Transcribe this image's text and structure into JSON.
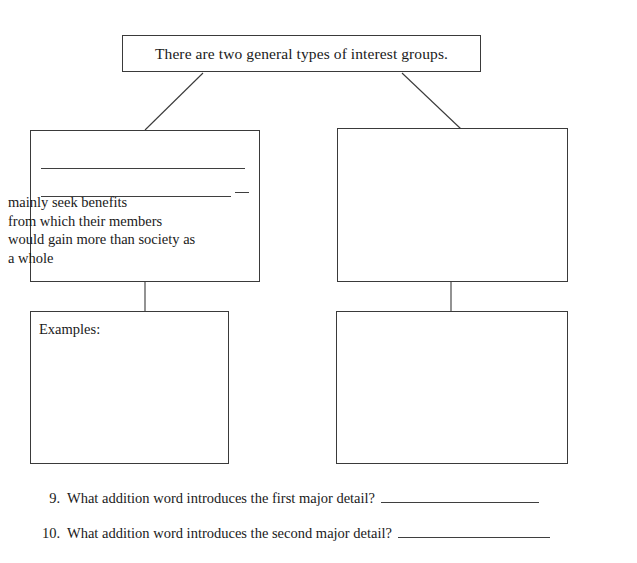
{
  "worksheet": {
    "title_box": {
      "text": "There are two general types of interest groups."
    },
    "left_branch": {
      "upper_box": {
        "blank_line_1": "",
        "blank_line_2": "",
        "body_lines": [
          "mainly seek benefits",
          "from which their members",
          "would gain more than society as",
          "a whole"
        ]
      },
      "lower_box": {
        "label": "Examples:",
        "content": ""
      }
    },
    "right_branch": {
      "upper_box": {
        "content": ""
      },
      "lower_box": {
        "content": ""
      }
    },
    "questions": [
      {
        "number": "9.",
        "text": "What addition word introduces the first major detail?",
        "answer": ""
      },
      {
        "number": "10.",
        "text": "What addition word introduces the second major detail?",
        "answer": ""
      }
    ]
  },
  "colors": {
    "page_background": "#ffffff",
    "box_border": "#3a3a3a",
    "rule_line": "#3f3f3f",
    "text": "#1a1a1a"
  }
}
